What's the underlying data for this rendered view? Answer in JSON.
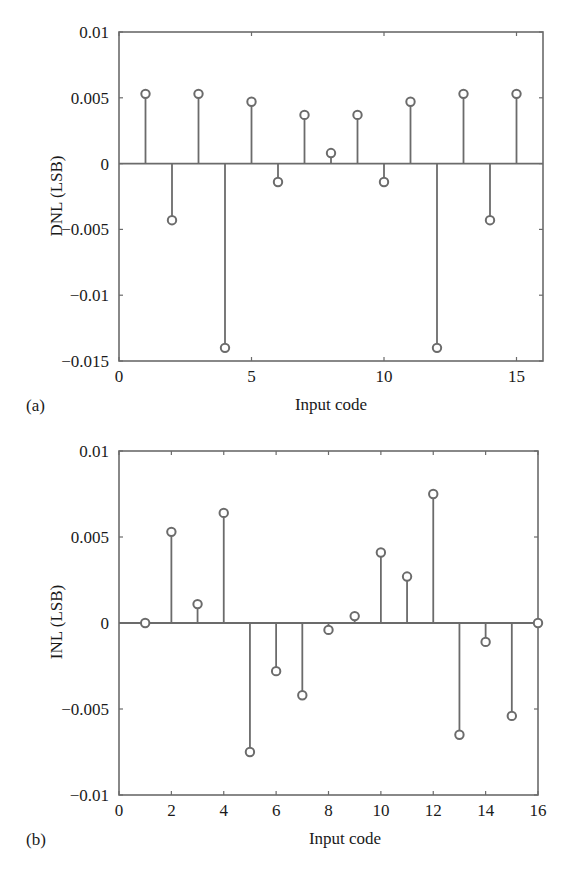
{
  "chart_data": [
    {
      "type": "stem",
      "panel_label": "(a)",
      "title": "",
      "xlabel": "Input code",
      "ylabel": "DNL (LSB)",
      "xlim": [
        0,
        16
      ],
      "ylim": [
        -0.015,
        0.01
      ],
      "xticks": [
        0,
        5,
        10,
        15
      ],
      "xtick_labels": [
        "0",
        "5",
        "10",
        "15"
      ],
      "yticks": [
        0.01,
        0.005,
        0,
        -0.005,
        -0.01,
        -0.015
      ],
      "ytick_labels": [
        "0.01",
        "0.005",
        "0",
        "−0.005",
        "−0.01",
        "−0.015"
      ],
      "grid": false,
      "x": [
        1,
        2,
        3,
        4,
        5,
        6,
        7,
        8,
        9,
        10,
        11,
        12,
        13,
        14,
        15
      ],
      "values": [
        0.0053,
        -0.0043,
        0.0053,
        -0.014,
        0.0047,
        -0.0014,
        0.0037,
        0.0008,
        0.0037,
        -0.0014,
        0.0047,
        -0.014,
        0.0053,
        -0.0043,
        0.0053
      ]
    },
    {
      "type": "stem",
      "panel_label": "(b)",
      "title": "",
      "xlabel": "Input code",
      "ylabel": "INL (LSB)",
      "xlim": [
        0,
        16
      ],
      "ylim": [
        -0.01,
        0.01
      ],
      "xticks": [
        0,
        2,
        4,
        6,
        8,
        10,
        12,
        14,
        16
      ],
      "xtick_labels": [
        "0",
        "2",
        "4",
        "6",
        "8",
        "10",
        "12",
        "14",
        "16"
      ],
      "yticks": [
        0.01,
        0.005,
        0,
        -0.005,
        -0.01
      ],
      "ytick_labels": [
        "0.01",
        "0.005",
        "0",
        "−0.005",
        "−0.01"
      ],
      "grid": false,
      "x": [
        1,
        2,
        3,
        4,
        5,
        6,
        7,
        8,
        9,
        10,
        11,
        12,
        13,
        14,
        15,
        16
      ],
      "values": [
        0.0,
        0.0053,
        0.0011,
        0.0064,
        -0.0075,
        -0.0028,
        -0.0042,
        -0.0004,
        0.0004,
        0.0041,
        0.0027,
        0.0075,
        -0.0065,
        -0.0011,
        -0.0054,
        0.0
      ]
    }
  ],
  "style": {
    "axis_color": "#6b6b6b",
    "stem_color": "#6b6b6b",
    "marker_stroke": "#6b6b6b",
    "marker_fill": "#ffffff",
    "text_color": "#1a1a1a"
  }
}
